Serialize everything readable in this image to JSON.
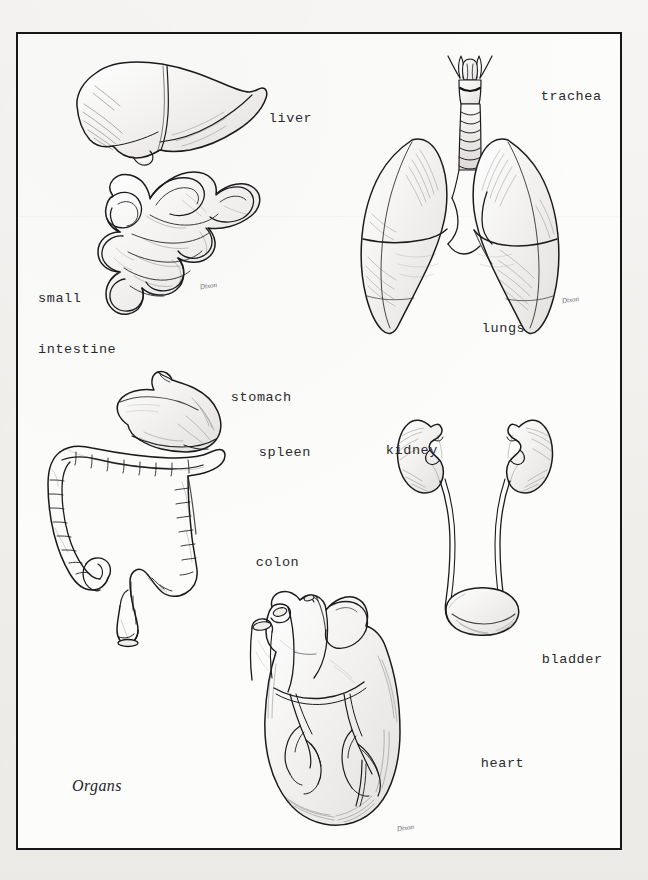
{
  "plate": {
    "caption": "Organs",
    "background_color": "#f2f1ef",
    "paper_color": "#fcfcfb",
    "ink_color": "#17171a",
    "frame": {
      "x": 16,
      "y": 32,
      "width": 606,
      "height": 818,
      "border_width": 2.5
    }
  },
  "labels": [
    {
      "id": "liver",
      "text": "liver",
      "x": 234,
      "y": 96,
      "lines": [
        "liver"
      ]
    },
    {
      "id": "trachea",
      "text": "trachea",
      "x": 506,
      "y": 74,
      "lines": [
        "trachea"
      ]
    },
    {
      "id": "small-intestine",
      "text": "small\nintestine",
      "x": 38,
      "y": 256,
      "lines": [
        "small",
        "intestine"
      ]
    },
    {
      "id": "lungs",
      "text": "lungs",
      "x": 447,
      "y": 306,
      "lines": [
        "lungs"
      ]
    },
    {
      "id": "stomach",
      "text": "stomach",
      "x": 196,
      "y": 375,
      "lines": [
        "stomach"
      ]
    },
    {
      "id": "spleen",
      "text": "spleen",
      "x": 224,
      "y": 430,
      "lines": [
        "spleen"
      ]
    },
    {
      "id": "kidney",
      "text": "kidney",
      "x": 351,
      "y": 428,
      "lines": [
        "kidney"
      ]
    },
    {
      "id": "colon",
      "text": "colon",
      "x": 221,
      "y": 540,
      "lines": [
        "colon"
      ]
    },
    {
      "id": "bladder",
      "text": "bladder",
      "x": 507,
      "y": 637,
      "lines": [
        "bladder"
      ]
    },
    {
      "id": "heart",
      "text": "heart",
      "x": 446,
      "y": 741,
      "lines": [
        "heart"
      ]
    }
  ],
  "signatures": [
    {
      "id": "signature-small-intestine",
      "text": "Dixon",
      "x": 200,
      "y": 282
    },
    {
      "id": "signature-lungs",
      "text": "Dixon",
      "x": 562,
      "y": 296
    },
    {
      "id": "signature-heart",
      "text": "Dixon",
      "x": 397,
      "y": 824
    }
  ],
  "illustrations": [
    {
      "id": "liver",
      "name": "liver-illustration",
      "label": "liver"
    },
    {
      "id": "small-intestine",
      "name": "small-intestine-illustration",
      "label": "small intestine"
    },
    {
      "id": "trachea",
      "name": "trachea-illustration",
      "label": "trachea"
    },
    {
      "id": "lungs",
      "name": "lungs-illustration",
      "label": "lungs"
    },
    {
      "id": "stomach",
      "name": "stomach-illustration",
      "label": "stomach"
    },
    {
      "id": "colon",
      "name": "colon-illustration",
      "label": "colon"
    },
    {
      "id": "kidneys",
      "name": "kidneys-illustration",
      "label": "kidney"
    },
    {
      "id": "bladder",
      "name": "bladder-illustration",
      "label": "bladder"
    },
    {
      "id": "heart",
      "name": "heart-illustration",
      "label": "heart"
    }
  ]
}
